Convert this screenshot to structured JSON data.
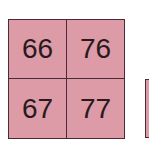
{
  "grid": {
    "cells": [
      {
        "label": "66"
      },
      {
        "label": "76"
      },
      {
        "label": "67"
      },
      {
        "label": "77"
      }
    ],
    "fill_color": "#dd9aa7",
    "border_color": "#4a2a35"
  }
}
